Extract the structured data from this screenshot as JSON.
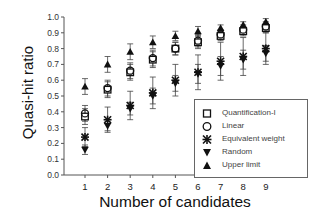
{
  "chart_data": {
    "type": "scatter",
    "title": "",
    "xlabel": "Number of candidates",
    "ylabel": "Quasi-hit ratio",
    "x": [
      1,
      2,
      3,
      4,
      5,
      6,
      7,
      8,
      9
    ],
    "xticks": [
      "1",
      "2",
      "3",
      "4",
      "5",
      "6",
      "7",
      "8",
      "9"
    ],
    "yticks": [
      "0.0",
      "0.1",
      "0.2",
      "0.3",
      "0.4",
      "0.5",
      "0.6",
      "0.7",
      "0.8",
      "0.9",
      "1.0"
    ],
    "ylim": [
      0,
      1.0
    ],
    "xlim": [
      0.3,
      10
    ],
    "grid": false,
    "legend_position": "lower right (inside)",
    "error_bars": true,
    "series": [
      {
        "name": "Quantification-I",
        "marker": "open-square",
        "values": [
          0.37,
          0.54,
          0.65,
          0.73,
          0.8,
          0.84,
          0.88,
          0.91,
          0.93
        ],
        "err": [
          0.05,
          0.05,
          0.05,
          0.05,
          0.04,
          0.04,
          0.03,
          0.03,
          0.03
        ]
      },
      {
        "name": "Linear",
        "marker": "open-circle",
        "values": [
          0.39,
          0.55,
          0.66,
          0.74,
          0.8,
          0.85,
          0.89,
          0.92,
          0.94
        ],
        "err": [
          0.05,
          0.05,
          0.05,
          0.05,
          0.04,
          0.04,
          0.03,
          0.03,
          0.03
        ]
      },
      {
        "name": "Equivalent weight",
        "marker": "asterisk",
        "values": [
          0.24,
          0.35,
          0.44,
          0.52,
          0.6,
          0.65,
          0.72,
          0.75,
          0.8
        ],
        "err": [
          0.06,
          0.08,
          0.09,
          0.1,
          0.1,
          0.11,
          0.12,
          0.12,
          0.1
        ]
      },
      {
        "name": "Random",
        "marker": "filled-triangle-down",
        "values": [
          0.16,
          0.31,
          0.42,
          0.5,
          0.58,
          0.64,
          0.69,
          0.73,
          0.77
        ],
        "err": [
          0.03,
          0.03,
          0.04,
          0.05,
          0.05,
          0.06,
          0.06,
          0.06,
          0.05
        ]
      },
      {
        "name": "Upper limit",
        "marker": "filled-triangle-up",
        "values": [
          0.56,
          0.7,
          0.78,
          0.84,
          0.88,
          0.91,
          0.93,
          0.95,
          0.97
        ],
        "err": [
          0.05,
          0.05,
          0.05,
          0.04,
          0.03,
          0.03,
          0.02,
          0.02,
          0.02
        ]
      }
    ]
  },
  "legend": {
    "items": [
      {
        "label": "Quantification-I"
      },
      {
        "label": "Linear"
      },
      {
        "label": "Equivalent weight"
      },
      {
        "label": "Random"
      },
      {
        "label": "Upper limit"
      }
    ]
  }
}
